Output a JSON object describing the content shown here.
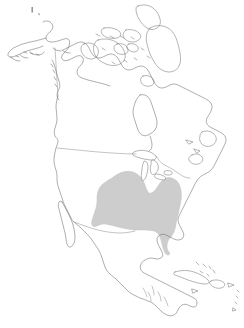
{
  "figure": {
    "kind": "species-range-map",
    "width": 244,
    "height": 328,
    "background_color": "#ffffff",
    "caption": ""
  },
  "map": {
    "projection_note": "",
    "coastline_color": "#6b6b6b",
    "border_color": "#7a7a7a",
    "lake_fill_color": "#ffffff",
    "range_fill_color": "#cdcdcd",
    "range_stroke_color": "#bdbdbd"
  },
  "legend": {
    "present": false,
    "entries": []
  },
  "labels": {
    "present": false,
    "items": []
  },
  "regions": [
    {
      "name": "alaska",
      "label": ""
    },
    {
      "name": "canada-mainland",
      "label": ""
    },
    {
      "name": "canadian-arctic-archipelago",
      "label": ""
    },
    {
      "name": "united-states",
      "label": ""
    },
    {
      "name": "mexico",
      "label": ""
    },
    {
      "name": "central-america",
      "label": ""
    },
    {
      "name": "caribbean-islands",
      "label": ""
    }
  ],
  "range": {
    "name": "distribution-range",
    "label": "",
    "coverage_description": "eastern and central United States",
    "fill": "#cdcdcd"
  }
}
